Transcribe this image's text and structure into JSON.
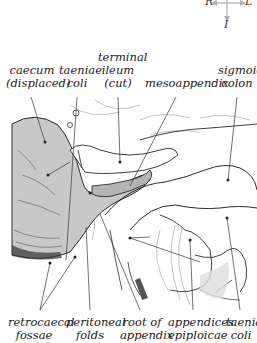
{
  "orientation": {
    "right": "R",
    "left": "L",
    "inferior": "I"
  },
  "labels_top": [
    {
      "id": "caecum",
      "lines": [
        "caecum",
        "(displaced)"
      ]
    },
    {
      "id": "taeniae-coli-top",
      "lines": [
        "taeniae",
        "coli"
      ]
    },
    {
      "id": "terminal-ileum",
      "lines": [
        "terminal",
        "ileum",
        "(cut)"
      ]
    },
    {
      "id": "mesoappendix",
      "lines": [
        "mesoappendix"
      ]
    },
    {
      "id": "sigmoid-colon",
      "lines": [
        "sigmoid",
        "colon"
      ]
    }
  ],
  "labels_bottom": [
    {
      "id": "retrocaecal-fossae",
      "lines": [
        "retrocaecal",
        "fossae"
      ]
    },
    {
      "id": "peritoneal-folds",
      "lines": [
        "peritoneal",
        "folds"
      ]
    },
    {
      "id": "root-of-appendix",
      "lines": [
        "root of",
        "appendix"
      ]
    },
    {
      "id": "appendices-epiploicae",
      "lines": [
        "appendices",
        "epiploicae"
      ]
    },
    {
      "id": "taenia-coli-bottom",
      "lines": [
        "taenia",
        "coli"
      ]
    }
  ],
  "colors": {
    "caecum_fill": "#c8c8c8",
    "appendix_fill": "#b4b4b4",
    "outline": "#2a2a2a",
    "leader": "#333333",
    "label_text": "#222222",
    "orientation_arrow": "#b0b0b0"
  }
}
